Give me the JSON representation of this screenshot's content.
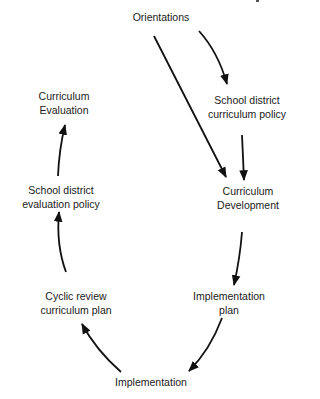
{
  "diagram": {
    "nodes": [
      {
        "id": "orientations",
        "lines": [
          "Orientations"
        ],
        "x": 161,
        "y": 17
      },
      {
        "id": "school-district-curriculum-policy",
        "lines": [
          "School district",
          "curriculum policy"
        ],
        "x": 247,
        "y": 93
      },
      {
        "id": "curriculum-development",
        "lines": [
          "Curriculum",
          "Development"
        ],
        "x": 248,
        "y": 168
      },
      {
        "id": "implementation-plan",
        "lines": [
          "Implementation",
          "plan"
        ],
        "x": 229,
        "y": 290
      },
      {
        "id": "implementation",
        "lines": [
          "Implementation"
        ],
        "x": 151,
        "y": 371
      },
      {
        "id": "cyclic-review-curriculum-plan",
        "lines": [
          "Cyclic review",
          "curriculum plan"
        ],
        "x": 76,
        "y": 290
      },
      {
        "id": "school-district-evaluation-policy",
        "lines": [
          "School district",
          "evaluation policy"
        ],
        "x": 61,
        "y": 183
      },
      {
        "id": "curriculum-evaluation",
        "lines": [
          "Curriculum",
          "Evaluation"
        ],
        "x": 64,
        "y": 89
      }
    ],
    "edges": [
      {
        "from": "orientations",
        "to": "school-district-curriculum-policy"
      },
      {
        "from": "orientations",
        "to": "curriculum-development"
      },
      {
        "from": "school-district-curriculum-policy",
        "to": "curriculum-development"
      },
      {
        "from": "curriculum-development",
        "to": "implementation-plan"
      },
      {
        "from": "implementation-plan",
        "to": "implementation"
      },
      {
        "from": "implementation",
        "to": "cyclic-review-curriculum-plan"
      },
      {
        "from": "cyclic-review-curriculum-plan",
        "to": "school-district-evaluation-policy"
      },
      {
        "from": "school-district-evaluation-policy",
        "to": "curriculum-evaluation"
      }
    ]
  }
}
